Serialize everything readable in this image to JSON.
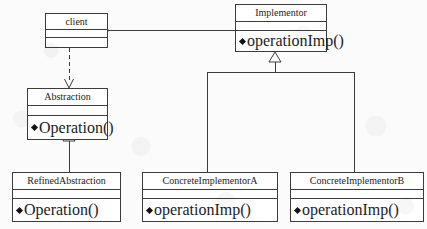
{
  "diagram": {
    "notation": "UML",
    "background_color": "#fbfbfb",
    "line_color": "#3c3c3c",
    "text_color": "#1c1c1c"
  },
  "classes": [
    {
      "id": "client",
      "name": "client",
      "compartments": [
        "",
        ""
      ],
      "attributes": [],
      "methods": []
    },
    {
      "id": "implementor",
      "name": "Implementor",
      "attributes": [],
      "methods": [
        "operationImp()"
      ]
    },
    {
      "id": "abstraction",
      "name": "Abstraction",
      "attributes": [],
      "methods": [
        "Operation()"
      ]
    },
    {
      "id": "refined_abstraction",
      "name": "RefinedAbstraction",
      "attributes": [],
      "methods": [
        "Operation()"
      ]
    },
    {
      "id": "concrete_implementor_a",
      "name": "ConcreteImplementorA",
      "attributes": [],
      "methods": [
        "operationImp()"
      ]
    },
    {
      "id": "concrete_implementor_b",
      "name": "ConcreteImplementorB",
      "attributes": [],
      "methods": [
        "operationImp()"
      ]
    }
  ],
  "relationships": [
    {
      "id": "client-implementor",
      "type": "aggregation",
      "from": "client",
      "to": "implementor",
      "decorator": "hollow-diamond",
      "line_style": "solid"
    },
    {
      "id": "client-abstraction",
      "type": "dependency",
      "from": "client",
      "to": "abstraction",
      "decorator": "open-arrow",
      "line_style": "dashed"
    },
    {
      "id": "refinedabstraction-abstraction",
      "type": "generalization",
      "from": "refined_abstraction",
      "to": "abstraction",
      "decorator": "hollow-triangle",
      "line_style": "solid"
    },
    {
      "id": "concreteimplementora-implementor",
      "type": "generalization",
      "from": "concrete_implementor_a",
      "to": "implementor",
      "decorator": "hollow-triangle",
      "line_style": "solid"
    },
    {
      "id": "concreteimplementorb-implementor",
      "type": "generalization",
      "from": "concrete_implementor_b",
      "to": "implementor",
      "decorator": "hollow-triangle",
      "line_style": "solid"
    }
  ]
}
